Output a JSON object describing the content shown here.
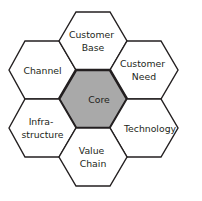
{
  "diagram": {
    "type": "hexagon-honeycomb",
    "background_color": "#ffffff",
    "outline_color": "#231f20",
    "core_fill_color": "#a9a9a9",
    "satellite_fill_color": "#ffffff",
    "text_color": "#231f20",
    "cells": [
      {
        "id": "core",
        "position": "center",
        "label": "Core",
        "lines": [
          "Core"
        ],
        "fill": "#a9a9a9",
        "emphasis": true
      },
      {
        "id": "customer-base",
        "position": "top",
        "label": "Customer Base",
        "lines": [
          "Customer",
          "Base"
        ],
        "fill": "#ffffff",
        "emphasis": false
      },
      {
        "id": "customer-need",
        "position": "upper-right",
        "label": "Customer Need",
        "lines": [
          "Customer",
          "Need"
        ],
        "fill": "#ffffff",
        "emphasis": false
      },
      {
        "id": "technology",
        "position": "lower-right",
        "label": "Technology",
        "lines": [
          "Technology"
        ],
        "fill": "#ffffff",
        "emphasis": false
      },
      {
        "id": "value-chain",
        "position": "bottom",
        "label": "Value Chain",
        "lines": [
          "Value",
          "Chain"
        ],
        "fill": "#ffffff",
        "emphasis": false
      },
      {
        "id": "infrastructure",
        "position": "lower-left",
        "label": "Infra-structure",
        "lines": [
          "Infra-",
          "structure"
        ],
        "fill": "#ffffff",
        "emphasis": false
      },
      {
        "id": "channel",
        "position": "upper-left",
        "label": "Channel",
        "lines": [
          "Channel"
        ],
        "fill": "#ffffff",
        "emphasis": false
      }
    ]
  }
}
